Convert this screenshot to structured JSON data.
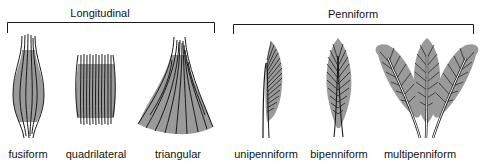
{
  "groups": [
    {
      "label": "Longitudinal",
      "members": [
        "fusiform",
        "quadrilateral",
        "triangular"
      ]
    },
    {
      "label": "Penniform",
      "members": [
        "unipenniform",
        "bipenniform",
        "multipenniform"
      ]
    }
  ],
  "muscles": [
    {
      "id": "fusiform",
      "label": "fusiform"
    },
    {
      "id": "quadrilateral",
      "label": "quadrilateral"
    },
    {
      "id": "triangular",
      "label": "triangular"
    },
    {
      "id": "unipenniform",
      "label": "unipenniform"
    },
    {
      "id": "bipenniform",
      "label": "bipenniform"
    },
    {
      "id": "multipenniform",
      "label": "multipenniform"
    }
  ],
  "colors": {
    "muscle_fill": "#9a9a9a",
    "line": "#1a1a1a",
    "background": "#ffffff"
  }
}
